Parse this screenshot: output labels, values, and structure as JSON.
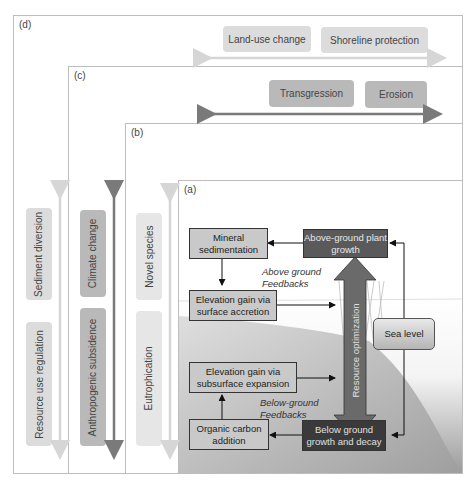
{
  "panels": {
    "d": {
      "label": "(d)",
      "top_items": [
        "Land-use change",
        "Shoreline protection"
      ],
      "side_items": [
        "Sediment diversion",
        "Resource use regulation"
      ]
    },
    "c": {
      "label": "(c)",
      "top_items": [
        "Transgression",
        "Erosion"
      ],
      "side_items": [
        "Climate change",
        "Anthropogenic subsidence"
      ]
    },
    "b": {
      "label": "(b)",
      "side_items": [
        "Novel species",
        "Eutrophication"
      ]
    },
    "a": {
      "label": "(a)",
      "boxes": {
        "mineral_sedimentation": "Mineral sedimentation",
        "above_ground_plant_growth": "Above-ground plant growth",
        "elevation_surface": "Elevation gain via surface accretion",
        "elevation_subsurface": "Elevation gain via subsurface expansion",
        "organic_carbon": "Organic carbon addition",
        "below_ground_growth": "Below ground growth and decay",
        "sea_level": "Sea level"
      },
      "annotations": {
        "above_feedbacks": "Above ground Feedbacks",
        "below_feedbacks": "Below-ground Feedbacks",
        "resource_optimization": "Resource optimization"
      }
    }
  },
  "colors": {
    "panel_border": "#bdbdbd",
    "dark_arrow": "#7a7a7a",
    "light_arrow": "#d6d6d6",
    "dark_box": "#5a5a5a",
    "black_box": "#3a3a3a",
    "light_box": "#c9c9c9"
  }
}
